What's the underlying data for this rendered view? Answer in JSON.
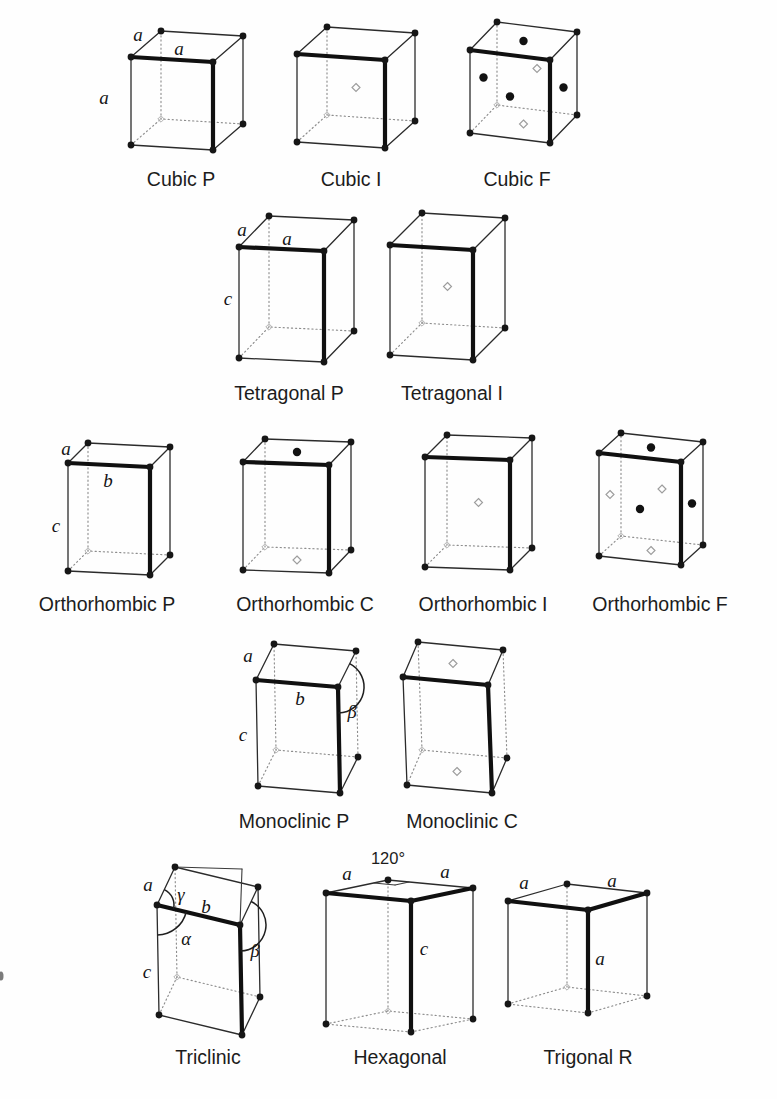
{
  "figure": {
    "background": "#fefefe",
    "ink": "#161616",
    "light_gray": "#9d9d9d",
    "cells": [
      {
        "caption": "Cubic P",
        "caption_pos": [
          181,
          186
        ],
        "box": {
          "F": [
            213,
            150
          ],
          "w": [
            82,
            5
          ],
          "d": [
            30,
            -26
          ],
          "u": [
            0,
            -88
          ]
        },
        "labels": [
          {
            "t": "a",
            "x": 138,
            "y": 41,
            "k": "i"
          },
          {
            "t": "a",
            "x": 179,
            "y": 55,
            "k": "i"
          },
          {
            "t": "a",
            "x": 104,
            "y": 104,
            "k": "i"
          }
        ],
        "marks": [],
        "style": {},
        "aux": [],
        "arcs": []
      },
      {
        "caption": "Cubic I",
        "caption_pos": [
          351,
          186
        ],
        "box": {
          "F": [
            385,
            148
          ],
          "w": [
            88,
            6
          ],
          "d": [
            30,
            -27
          ],
          "u": [
            0,
            -88
          ]
        },
        "labels": [],
        "marks": [
          {
            "face": "body",
            "shade": "light"
          }
        ],
        "style": {},
        "aux": [],
        "arcs": []
      },
      {
        "caption": "Cubic F",
        "caption_pos": [
          517,
          186
        ],
        "box": {
          "F": [
            550,
            143
          ],
          "w": [
            80,
            10
          ],
          "d": [
            27,
            -28
          ],
          "u": [
            0,
            -83
          ]
        },
        "labels": [],
        "marks": [
          {
            "face": "top",
            "shade": "dark"
          },
          {
            "face": "front",
            "shade": "dark"
          },
          {
            "face": "right",
            "shade": "dark"
          },
          {
            "face": "left",
            "shade": "dark"
          },
          {
            "face": "back",
            "shade": "light"
          },
          {
            "face": "bottom",
            "shade": "light"
          }
        ],
        "style": {},
        "aux": [],
        "arcs": []
      },
      {
        "caption": "Tetragonal P",
        "caption_pos": [
          289,
          400
        ],
        "box": {
          "F": [
            324,
            362
          ],
          "w": [
            85,
            4
          ],
          "d": [
            30,
            -31
          ],
          "u": [
            0,
            -111
          ]
        },
        "labels": [
          {
            "t": "a",
            "x": 242,
            "y": 236,
            "k": "i"
          },
          {
            "t": "a",
            "x": 287,
            "y": 245,
            "k": "i"
          },
          {
            "t": "c",
            "x": 228,
            "y": 305,
            "k": "i"
          }
        ],
        "marks": [],
        "style": {},
        "aux": [],
        "arcs": []
      },
      {
        "caption": "Tetragonal I",
        "caption_pos": [
          452,
          400
        ],
        "box": {
          "F": [
            473,
            360
          ],
          "w": [
            83,
            5
          ],
          "d": [
            32,
            -32
          ],
          "u": [
            0,
            -110
          ]
        },
        "labels": [],
        "marks": [
          {
            "face": "body",
            "shade": "light"
          }
        ],
        "style": {},
        "aux": [],
        "arcs": []
      },
      {
        "caption": "Orthorhombic P",
        "caption_pos": [
          107,
          611
        ],
        "box": {
          "F": [
            150,
            575
          ],
          "w": [
            82,
            4
          ],
          "d": [
            20,
            -20
          ],
          "u": [
            0,
            -108
          ]
        },
        "labels": [
          {
            "t": "a",
            "x": 66,
            "y": 455,
            "k": "i"
          },
          {
            "t": "b",
            "x": 108,
            "y": 487,
            "k": "i"
          },
          {
            "t": "c",
            "x": 56,
            "y": 532,
            "k": "i"
          }
        ],
        "marks": [],
        "style": {},
        "aux": [],
        "arcs": []
      },
      {
        "caption": "Orthorhombic C",
        "caption_pos": [
          305,
          611
        ],
        "box": {
          "F": [
            329,
            573
          ],
          "w": [
            86,
            3
          ],
          "d": [
            22,
            -23
          ],
          "u": [
            0,
            -108
          ]
        },
        "labels": [],
        "marks": [
          {
            "face": "top",
            "shade": "dark"
          },
          {
            "face": "bottom",
            "shade": "light"
          }
        ],
        "style": {},
        "aux": [],
        "arcs": []
      },
      {
        "caption": "Orthorhombic I",
        "caption_pos": [
          483,
          611
        ],
        "box": {
          "F": [
            510,
            570
          ],
          "w": [
            85,
            3
          ],
          "d": [
            22,
            -22
          ],
          "u": [
            0,
            -110
          ]
        },
        "labels": [],
        "marks": [
          {
            "face": "body",
            "shade": "light"
          }
        ],
        "style": {},
        "aux": [],
        "arcs": []
      },
      {
        "caption": "Orthorhombic F",
        "caption_pos": [
          660,
          611
        ],
        "box": {
          "F": [
            681,
            565
          ],
          "w": [
            82,
            9
          ],
          "d": [
            22,
            -20
          ],
          "u": [
            0,
            -103
          ]
        },
        "labels": [],
        "marks": [
          {
            "face": "top",
            "shade": "dark"
          },
          {
            "face": "front",
            "shade": "dark"
          },
          {
            "face": "right",
            "shade": "dark"
          },
          {
            "face": "left",
            "shade": "light"
          },
          {
            "face": "back",
            "shade": "light"
          },
          {
            "face": "bottom",
            "shade": "light"
          }
        ],
        "style": {},
        "aux": [],
        "arcs": []
      },
      {
        "caption": "Monoclinic P",
        "caption_pos": [
          294,
          828
        ],
        "box": {
          "F": [
            340,
            793
          ],
          "w": [
            82,
            7
          ],
          "d": [
            18,
            -36
          ],
          "u": [
            -2,
            -106
          ]
        },
        "labels": [
          {
            "t": "a",
            "x": 248,
            "y": 662,
            "k": "i"
          },
          {
            "t": "b",
            "x": 300,
            "y": 705,
            "k": "i"
          },
          {
            "t": "c",
            "x": 243,
            "y": 741,
            "k": "i"
          },
          {
            "t": "β",
            "x": 352,
            "y": 718,
            "k": "g"
          }
        ],
        "marks": [],
        "style": {
          "right_vertical_dotted": true
        },
        "aux": [],
        "arcs": [
          {
            "at": [
              338,
              687
            ],
            "from": [
              2,
              106
            ],
            "to": [
              18,
              -36
            ],
            "r": 26,
            "sweep": 0
          }
        ]
      },
      {
        "caption": "Monoclinic C",
        "caption_pos": [
          462,
          828
        ],
        "box": {
          "F": [
            492,
            793
          ],
          "w": [
            85,
            8
          ],
          "d": [
            15,
            -35
          ],
          "u": [
            -4,
            -108
          ]
        },
        "labels": [],
        "marks": [
          {
            "face": "top",
            "shade": "light"
          },
          {
            "face": "bottom",
            "shade": "light"
          }
        ],
        "style": {
          "right_vertical_dotted": true
        },
        "aux": [],
        "arcs": []
      },
      {
        "caption": "Triclinic",
        "caption_pos": [
          208,
          1064
        ],
        "box": {
          "F": [
            242,
            1035
          ],
          "w": [
            83,
            20
          ],
          "d": [
            18,
            -38
          ],
          "u": [
            -2,
            -110
          ]
        },
        "labels": [
          {
            "t": "a",
            "x": 148,
            "y": 891,
            "k": "i"
          },
          {
            "t": "γ",
            "x": 181,
            "y": 901,
            "k": "g"
          },
          {
            "t": "b",
            "x": 206,
            "y": 913,
            "k": "i"
          },
          {
            "t": "α",
            "x": 186,
            "y": 945,
            "k": "g"
          },
          {
            "t": "β",
            "x": 255,
            "y": 957,
            "k": "g"
          },
          {
            "t": "c",
            "x": 147,
            "y": 978,
            "k": "i"
          }
        ],
        "marks": [],
        "style": {},
        "aux": [
          {
            "a": [
              175,
              867
            ],
            "b": [
              242,
              869
            ]
          },
          {
            "a": [
              242,
              869
            ],
            "b": [
              240,
              925
            ]
          }
        ],
        "arcs": [
          {
            "at": [
              157,
              905
            ],
            "from": [
              18,
              -38
            ],
            "to": [
              83,
              20
            ],
            "r": 17,
            "sweep": 1
          },
          {
            "at": [
              157,
              905
            ],
            "from": [
              83,
              20
            ],
            "to": [
              2,
              110
            ],
            "r": 30,
            "sweep": 1
          },
          {
            "at": [
              240,
              925
            ],
            "from": [
              2,
              110
            ],
            "to": [
              18,
              -38
            ],
            "r": 26,
            "sweep": 0
          }
        ]
      },
      {
        "caption": "Hexagonal",
        "caption_pos": [
          400,
          1064
        ],
        "box": {
          "F": [
            411,
            1032
          ],
          "w": [
            85,
            8
          ],
          "d": [
            62,
            -13
          ],
          "u": [
            0,
            -131
          ]
        },
        "labels": [
          {
            "t": "a",
            "x": 347,
            "y": 880,
            "k": "i"
          },
          {
            "t": "120°",
            "x": 388,
            "y": 864,
            "k": "p"
          },
          {
            "t": "a",
            "x": 445,
            "y": 878,
            "k": "i"
          },
          {
            "t": "c",
            "x": 424,
            "y": 955,
            "k": "i"
          }
        ],
        "marks": [],
        "style": {
          "top_right_bold": true,
          "bottom_dotted": true
        },
        "aux": [
          {
            "a": [
              374,
              883
            ],
            "b": [
              395,
              885
            ]
          },
          {
            "a": [
              409,
              882
            ],
            "b": [
              395,
              885
            ]
          }
        ],
        "arcs": []
      },
      {
        "caption": "Trigonal R",
        "caption_pos": [
          588,
          1064
        ],
        "box": {
          "F": [
            588,
            1013
          ],
          "w": [
            80,
            9
          ],
          "d": [
            59,
            -17
          ],
          "u": [
            0,
            -103
          ]
        },
        "labels": [
          {
            "t": "a",
            "x": 524,
            "y": 889,
            "k": "i"
          },
          {
            "t": "a",
            "x": 612,
            "y": 887,
            "k": "i"
          },
          {
            "t": "a",
            "x": 600,
            "y": 965,
            "k": "i"
          }
        ],
        "marks": [],
        "style": {
          "top_right_bold": true,
          "bottom_dotted": true
        },
        "aux": [],
        "arcs": []
      }
    ],
    "scan_artifacts": [
      {
        "x": 1,
        "y": 976,
        "rx": 2.5,
        "ry": 4.5
      }
    ]
  }
}
